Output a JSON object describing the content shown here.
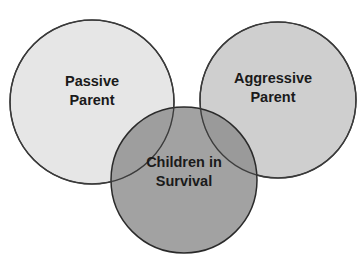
{
  "diagram": {
    "type": "venn",
    "circles": [
      {
        "id": "passive",
        "line1": "Passive",
        "line2": "Parent",
        "fill": "#e6e6e6"
      },
      {
        "id": "aggressive",
        "line1": "Aggressive",
        "line2": "Parent",
        "fill": "#cfcfcf"
      },
      {
        "id": "children",
        "line1": "Children in",
        "line2": "Survival",
        "fill": "#9a9a9a"
      }
    ],
    "stroke": "#3a3a3a"
  }
}
